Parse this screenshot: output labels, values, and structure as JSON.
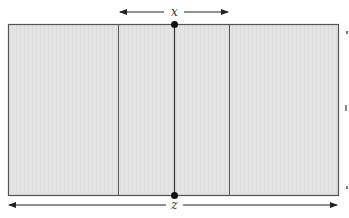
{
  "diagram": {
    "labels": {
      "top": "x",
      "bottom": "z"
    },
    "colors": {
      "fill": "#e3e3e3",
      "stroke": "#555555",
      "line": "#222222"
    },
    "rectangle": {
      "x": 8,
      "y": 24,
      "width": 330,
      "height": 171
    },
    "dividers": [
      118,
      174,
      229
    ],
    "center_points": [
      {
        "x": 174,
        "y": 24
      },
      {
        "x": 174,
        "y": 195
      }
    ],
    "top_dimension": {
      "from": 120,
      "to": 228,
      "y": 12,
      "label": "x"
    },
    "bottom_dimension": {
      "from": 8,
      "to": 338,
      "y": 205,
      "label": "z"
    }
  }
}
